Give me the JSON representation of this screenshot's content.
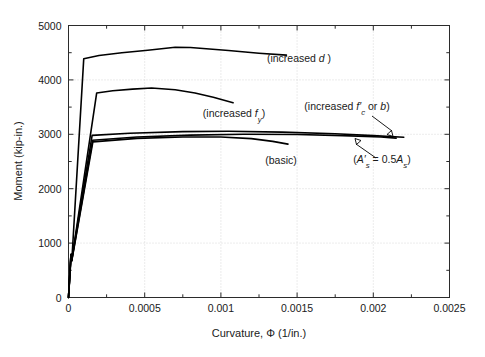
{
  "chart_data": {
    "type": "line",
    "title": "",
    "xlabel": "Curvature, Φ (1/in.)",
    "ylabel": "Moment (kip-in.)",
    "xlim": [
      0,
      0.0025
    ],
    "ylim": [
      0,
      5000
    ],
    "xticks": [
      0,
      0.0005,
      0.001,
      0.0015,
      0.002,
      0.0025
    ],
    "xtick_labels": [
      "0",
      "0.0005",
      "0.001",
      "0.0015",
      "0.002",
      "0.0025"
    ],
    "xminor_step": 0.00025,
    "yticks": [
      0,
      1000,
      2000,
      3000,
      4000,
      5000
    ],
    "ytick_labels": [
      "0",
      "1000",
      "2000",
      "3000",
      "4000",
      "5000"
    ],
    "yminor_step": 500,
    "grid": "dotted-major",
    "legend": "annotations-inline",
    "series": [
      {
        "name": "increased d",
        "label": "(increased d)",
        "points": [
          [
            0.0,
            0
          ],
          [
            1.8e-05,
            800
          ],
          [
            2.2e-05,
            690
          ],
          [
            0.0001,
            4390
          ],
          [
            0.0002,
            4450
          ],
          [
            0.00035,
            4500
          ],
          [
            0.00052,
            4545
          ],
          [
            0.0007,
            4600
          ],
          [
            0.0008,
            4595
          ],
          [
            0.00105,
            4540
          ],
          [
            0.00125,
            4490
          ],
          [
            0.00143,
            4455
          ]
        ]
      },
      {
        "name": "increased f_y",
        "label": "(increased f_y)",
        "points": [
          [
            0.0,
            0
          ],
          [
            1.6e-05,
            790
          ],
          [
            2.1e-05,
            680
          ],
          [
            0.000185,
            3760
          ],
          [
            0.00029,
            3800
          ],
          [
            0.00042,
            3830
          ],
          [
            0.000545,
            3850
          ],
          [
            0.0007,
            3820
          ],
          [
            0.00083,
            3760
          ],
          [
            0.00095,
            3680
          ],
          [
            0.00108,
            3580
          ]
        ]
      },
      {
        "name": "increased f'_c or b",
        "label": "(increased f'_c or b)",
        "points": [
          [
            0.0,
            0
          ],
          [
            1.6e-05,
            790
          ],
          [
            2.1e-05,
            690
          ],
          [
            0.000155,
            2980
          ],
          [
            0.0004,
            3020
          ],
          [
            0.00075,
            3050
          ],
          [
            0.00105,
            3055
          ],
          [
            0.0014,
            3040
          ],
          [
            0.00175,
            3010
          ],
          [
            0.002,
            2975
          ],
          [
            0.0022,
            2945
          ]
        ]
      },
      {
        "name": "A's = 0.5As",
        "label": "(A'_s = 0.5A_s)",
        "points": [
          [
            0.0,
            0
          ],
          [
            1.6e-05,
            780
          ],
          [
            2.1e-05,
            680
          ],
          [
            0.000158,
            2890
          ],
          [
            0.00045,
            2950
          ],
          [
            0.0008,
            2985
          ],
          [
            0.00115,
            3000
          ],
          [
            0.0015,
            2995
          ],
          [
            0.0018,
            2975
          ],
          [
            0.00205,
            2950
          ],
          [
            0.00215,
            2930
          ]
        ]
      },
      {
        "name": "basic",
        "label": "(basic)",
        "points": [
          [
            0.0,
            0
          ],
          [
            1.6e-05,
            770
          ],
          [
            2.1e-05,
            670
          ],
          [
            0.00016,
            2860
          ],
          [
            0.00045,
            2925
          ],
          [
            0.00075,
            2950
          ],
          [
            0.001,
            2950
          ],
          [
            0.0012,
            2920
          ],
          [
            0.00134,
            2870
          ],
          [
            0.00144,
            2820
          ]
        ]
      }
    ],
    "annotations": [
      {
        "id": "annot-increased-d",
        "text_parts": [
          "(increased ",
          "d",
          ")"
        ],
        "plain": "(increased d)",
        "x_px": 299,
        "y_px": 62,
        "has_leader": false
      },
      {
        "id": "annot-increased-fy",
        "text_parts": [
          "(increased ",
          "f",
          "y",
          ")"
        ],
        "plain": "(increased fy)",
        "x_px": 234,
        "y_px": 117,
        "has_leader": false
      },
      {
        "id": "annot-increased-fc-or-b",
        "text_parts": [
          "(increased ",
          "f'",
          "c",
          " or ",
          "b",
          ")"
        ],
        "plain": "(increased f'c or b)",
        "x_px": 347,
        "y_px": 110,
        "has_leader": true
      },
      {
        "id": "annot-as-half",
        "text_parts": [
          "(",
          "A'",
          "s",
          " = 0.5",
          "A",
          "s",
          ")"
        ],
        "plain": "(A's = 0.5As)",
        "x_px": 382,
        "y_px": 163,
        "has_leader": true
      },
      {
        "id": "annot-basic",
        "text_parts": [
          "(basic)"
        ],
        "plain": "(basic)",
        "x_px": 281,
        "y_px": 164,
        "has_leader": false
      }
    ],
    "colors": {
      "curve": "#000000",
      "frame": "#2b2b2b",
      "grid": "#c9c9c9",
      "background": "#ffffff",
      "text": "#1a1a1a"
    }
  },
  "axis": {
    "x_title": "Curvature, Φ (1/in.)",
    "y_title": "Moment (kip-in.)",
    "x_tick_labels": [
      "0",
      "0.0005",
      "0.001",
      "0.0015",
      "0.002",
      "0.0025"
    ],
    "y_tick_labels": [
      "0",
      "1000",
      "2000",
      "3000",
      "4000",
      "5000"
    ]
  }
}
